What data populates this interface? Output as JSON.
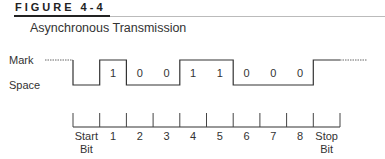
{
  "figure": {
    "label": "FIGURE 4-4",
    "title": "Asynchronous Transmission"
  },
  "levels": {
    "mark": "Mark",
    "space": "Space"
  },
  "waveform": {
    "bits": [
      "1",
      "0",
      "0",
      "1",
      "1",
      "0",
      "0",
      "0"
    ]
  },
  "axis": {
    "labels": [
      "Start",
      "1",
      "2",
      "3",
      "4",
      "5",
      "6",
      "7",
      "8",
      "Stop"
    ],
    "sublabels": [
      "Bit",
      "",
      "",
      "",
      "",
      "",
      "",
      "",
      "",
      "Bit"
    ]
  },
  "colors": {
    "line": "#333333",
    "dotted": "#666666"
  }
}
